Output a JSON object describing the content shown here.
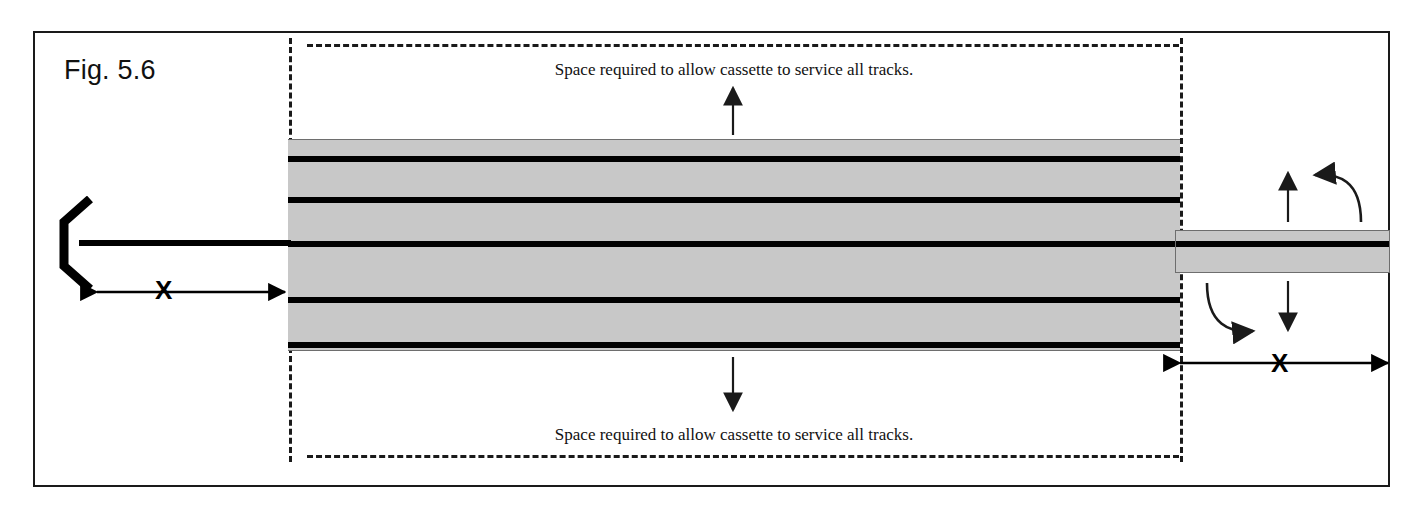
{
  "figure": {
    "label": "Fig. 5.6",
    "caption_top": "Space required to allow cassette to service all tracks.",
    "caption_bottom": "Space required to allow cassette to service all tracks.",
    "dimension_left_label": "X",
    "dimension_right_label": "X"
  },
  "colors": {
    "ink": "#1a1a1a",
    "rail": "#000000",
    "yard_fill": "#c8c8c8",
    "yard_edge": "#6e6e6e",
    "background": "#ffffff"
  },
  "layout": {
    "frame": {
      "x": 33,
      "y": 31,
      "width": 1357,
      "height": 456
    },
    "yard": {
      "x": 288,
      "y": 139,
      "width": 892,
      "height": 212
    },
    "cassette": {
      "x": 1175,
      "y": 230,
      "width": 215,
      "height": 43
    },
    "clearance_zone": {
      "x": 289,
      "y": 38,
      "width": 891,
      "height": 424
    }
  },
  "tracks": {
    "count": 5,
    "rail_offsets": [
      16,
      57,
      101,
      157,
      202
    ],
    "names": [
      "track-1",
      "track-2",
      "track-3",
      "track-4",
      "track-5"
    ]
  },
  "annotations": {
    "arrow_up_top": "arrow-up",
    "arrow_down_bottom": "arrow-down",
    "arrow_up_cassette": "arrow-up",
    "arrow_down_cassette": "arrow-down",
    "curve_arrow_upper": "curved-arrow-counterclockwise",
    "curve_arrow_lower": "curved-arrow-clockwise",
    "buffer_stop": "buffer-stop-bracket"
  }
}
